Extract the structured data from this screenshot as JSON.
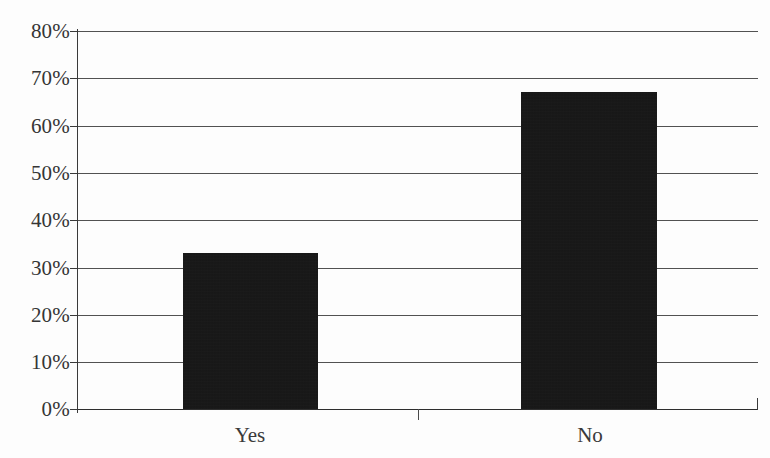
{
  "chart_data": {
    "type": "bar",
    "title": "",
    "subtitle": "",
    "xlabel": "",
    "ylabel": "",
    "categories": [
      "Yes",
      "No"
    ],
    "values": [
      33,
      67
    ],
    "value_labels": [
      "33%",
      "67%"
    ],
    "series": [
      {
        "name": "",
        "values": [
          33,
          67
        ]
      }
    ],
    "ylim": [
      0,
      80
    ],
    "y_tick_values": [
      0,
      10,
      20,
      30,
      40,
      50,
      60,
      70,
      80
    ],
    "y_tick_labels": [
      "0%",
      "10%",
      "20%",
      "30%",
      "40%",
      "50%",
      "60%",
      "70%",
      "80%"
    ],
    "grid": "horizontal",
    "legend": "none",
    "bar_color": "#131313",
    "axis_color": "#3a3a3a",
    "background_color": "#fdfdfd",
    "annotations": []
  },
  "axes": {
    "y": {
      "ticks": [
        {
          "label": "80%",
          "value": 80
        },
        {
          "label": "70%",
          "value": 70
        },
        {
          "label": "60%",
          "value": 60
        },
        {
          "label": "50%",
          "value": 50
        },
        {
          "label": "40%",
          "value": 40
        },
        {
          "label": "30%",
          "value": 30
        },
        {
          "label": "20%",
          "value": 20
        },
        {
          "label": "10%",
          "value": 10
        },
        {
          "label": "0%",
          "value": 0
        }
      ]
    },
    "x": {
      "ticks": [
        {
          "label": "Yes"
        },
        {
          "label": "No"
        }
      ]
    }
  }
}
